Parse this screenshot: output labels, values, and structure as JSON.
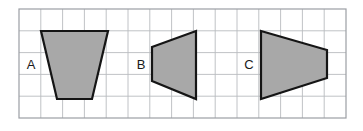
{
  "figure": {
    "canvas": {
      "width": 363,
      "height": 131,
      "background": "#ffffff"
    },
    "grid": {
      "name": "square-grid",
      "origin_x": 19,
      "origin_y": 9,
      "cell_size": 21.8,
      "columns": 15,
      "rows": 5,
      "line_color": "#b9bbc0",
      "line_width": 0.9,
      "border_color": "#9b9ea4",
      "border_width": 1.2,
      "visible": true
    },
    "style": {
      "fill": "#a8a8a8",
      "stroke": "#151515",
      "stroke_width": 2.2,
      "label_color": "#1a1a1a",
      "label_font_size": 13
    },
    "shapes": [
      {
        "id": "shape-a",
        "label": "A",
        "type": "trapezoid",
        "description": "isosceles trapezoid, wide top narrow bottom",
        "points": "41,31 108,31 92,99 57,99",
        "label_x": 31,
        "label_y": 66
      },
      {
        "id": "shape-b",
        "label": "B",
        "type": "trapezoid",
        "description": "trapezoid, short left side tall right side",
        "points": "152,47 196,31 196,99 152,81",
        "label_x": 141,
        "label_y": 66
      },
      {
        "id": "shape-c",
        "label": "C",
        "type": "trapezoid",
        "description": "trapezoid, tall left side short right side",
        "points": "261,31 327,50 327,78 261,99",
        "label_x": 249,
        "label_y": 66
      }
    ]
  }
}
